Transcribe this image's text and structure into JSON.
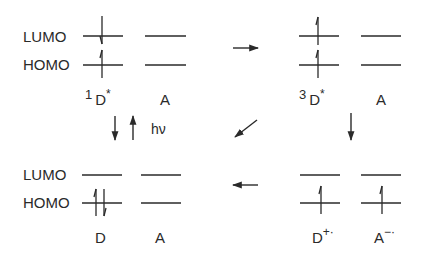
{
  "diagram": {
    "type": "energy-level / photoinduced electron transfer scheme",
    "line_color": "#2a2a2a",
    "row_labels": {
      "lumo": "LUMO",
      "homo": "HOMO"
    },
    "panels": {
      "top_left": {
        "donor": {
          "prefix": "1",
          "name": "D",
          "suffix": "*"
        },
        "acceptor": {
          "name": "A",
          "suffix": ""
        },
        "electrons": "donor LUMO: one down-spin; donor HOMO: one up-spin (singlet excited)"
      },
      "top_right": {
        "donor": {
          "prefix": "3",
          "name": "D",
          "suffix": "*"
        },
        "acceptor": {
          "name": "A",
          "suffix": ""
        },
        "electrons": "donor LUMO: one up-spin; donor HOMO: one up-spin (triplet excited)"
      },
      "bottom_left": {
        "donor": {
          "prefix": "",
          "name": "D",
          "suffix": ""
        },
        "acceptor": {
          "name": "A",
          "suffix": ""
        },
        "electrons": "donor HOMO: paired up/down (ground state)"
      },
      "bottom_right": {
        "donor": {
          "prefix": "",
          "name": "D",
          "suffix": "+·"
        },
        "acceptor": {
          "name": "A",
          "suffix": "−·"
        },
        "electrons": "donor HOMO: one up-spin; acceptor HOMO: one up-spin (radical ion pair)"
      }
    },
    "transitions": {
      "excitation_label": "hν",
      "arrows": [
        {
          "from": "top_left",
          "to": "top_right",
          "direction": "right"
        },
        {
          "from": "top_right",
          "to": "bottom_right",
          "direction": "down"
        },
        {
          "from": "top_right",
          "to": "bottom_left",
          "direction": "down-left"
        },
        {
          "from": "bottom_right",
          "to": "bottom_left",
          "direction": "left"
        },
        {
          "from": "bottom_left",
          "to": "top_left",
          "direction": "up",
          "label": "hν"
        },
        {
          "from": "top_left",
          "to": "bottom_left",
          "direction": "down"
        }
      ]
    }
  }
}
